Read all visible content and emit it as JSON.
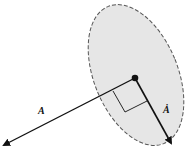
{
  "diagram": {
    "labels": {
      "vector_a": "A",
      "vector_a_dot": "Ȧ"
    },
    "colors": {
      "ellipse_fill": "#e6e6e6",
      "ellipse_stroke": "#555555",
      "line": "#111111"
    }
  }
}
